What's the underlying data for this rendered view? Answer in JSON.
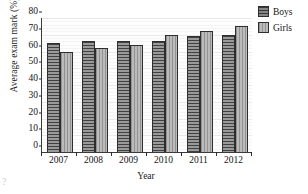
{
  "chart_data": {
    "type": "bar",
    "title": "",
    "xlabel": "Year",
    "ylabel": "Average exam mark (%)",
    "categories": [
      "2007",
      "2008",
      "2009",
      "2010",
      "2011",
      "2012"
    ],
    "series": [
      {
        "name": "Boys",
        "values": [
          65,
          66,
          66,
          66,
          69,
          70
        ],
        "color": "#6f6f6f"
      },
      {
        "name": "Girls",
        "values": [
          60,
          62,
          64,
          70,
          72,
          75
        ],
        "color": "#a8a8a8"
      }
    ],
    "ylim": [
      0,
      80
    ],
    "yticks": [
      0,
      10,
      20,
      30,
      40,
      50,
      60,
      70,
      80
    ],
    "ytick_labels": [
      "0",
      "10",
      "20",
      "30",
      "40",
      "50",
      "60",
      "70",
      "80"
    ],
    "grid": true,
    "grid_orientation": "horizontal",
    "legend_position": "right-top",
    "legend_entries": [
      "Boys",
      "Girls"
    ]
  },
  "axes": {
    "y_title": "Average exam mark (%)",
    "x_title": "Year"
  },
  "legend": {
    "items": [
      {
        "label": "Boys",
        "swatch": "boys-swatch"
      },
      {
        "label": "Girls",
        "swatch": "girls-swatch"
      }
    ]
  },
  "artifact": {
    "corner_mark": "?"
  }
}
